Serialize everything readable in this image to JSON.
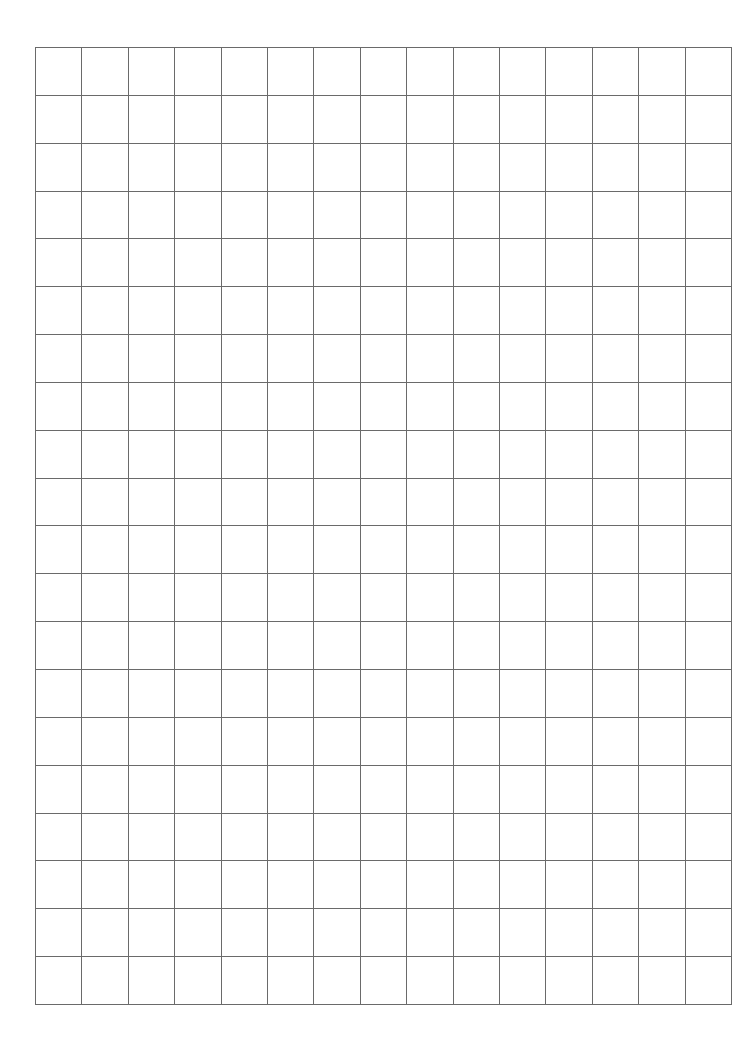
{
  "page": {
    "type": "grid-paper",
    "background": "#ffffff",
    "line_color": "#6a6a6a",
    "grid": {
      "columns": 15,
      "rows": 20,
      "left": 35,
      "top": 47,
      "width": 697,
      "height": 958
    }
  }
}
